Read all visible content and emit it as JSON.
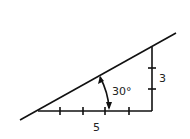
{
  "diagram": {
    "title": "",
    "angle_label": "30°",
    "vertical_label": "3",
    "horizontal_label": "5",
    "stroke_color": "#111111",
    "horizontal_ticks": 4,
    "vertical_ticks": 2
  }
}
